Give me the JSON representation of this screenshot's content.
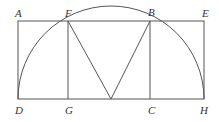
{
  "labels": {
    "A": "A",
    "F": "F",
    "B": "B",
    "E": "E",
    "D": "D",
    "G": "G",
    "C": "C",
    "H": "H"
  },
  "colors": {
    "line": "#555555",
    "text": "#333333"
  }
}
